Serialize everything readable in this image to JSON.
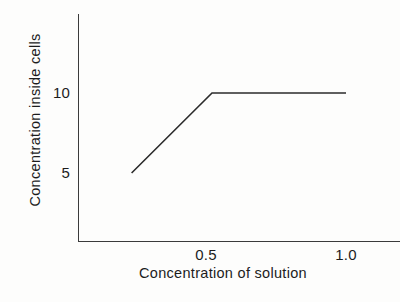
{
  "chart_data": {
    "type": "line",
    "title": "",
    "subtitle": "",
    "xlabel": "Concentration of solution",
    "ylabel": "Concentration inside cells",
    "xlim": [
      0.0,
      1.12
    ],
    "ylim": [
      0,
      15.8
    ],
    "grid": false,
    "legend": null,
    "x_ticks": [
      {
        "value": 0.5,
        "label": "0.5"
      },
      {
        "value": 1.0,
        "label": "1.0"
      }
    ],
    "y_ticks": [
      {
        "value": 5,
        "label": "5"
      },
      {
        "value": 10,
        "label": "10"
      }
    ],
    "series": [
      {
        "name": "uptake",
        "color": "#2b2b2b",
        "x": [
          0.2,
          0.5,
          1.0
        ],
        "y": [
          5,
          10,
          10
        ]
      }
    ],
    "annotations": []
  },
  "axes": {
    "y_axis_label": "Concentration inside cells",
    "x_axis_label": "Concentration of solution",
    "y_tick_10": "10",
    "y_tick_5": "5",
    "x_tick_05": "0.5",
    "x_tick_10": "1.0"
  },
  "style": {
    "ink_color": "#2b2b2b",
    "axis_color": "#3b3b3b",
    "background": "#fdfdfc"
  }
}
